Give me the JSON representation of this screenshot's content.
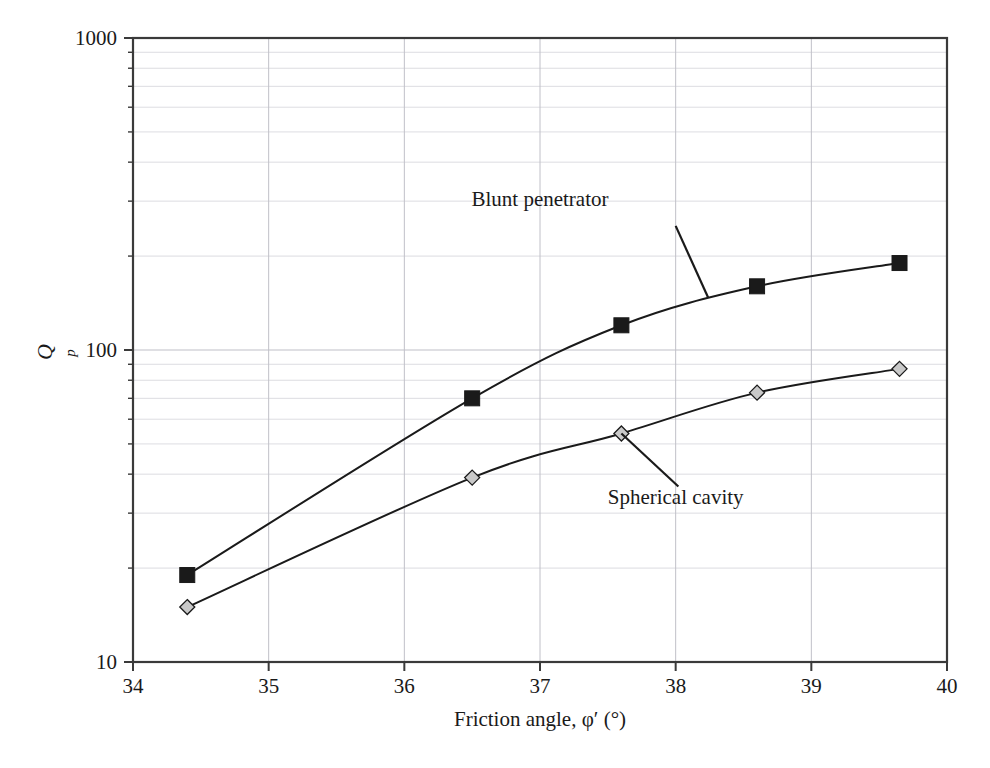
{
  "chart_data": {
    "type": "line",
    "title": "",
    "xlabel": "Friction angle, φ′ (°)",
    "ylabel": "Qp",
    "ylabel_main": "Q",
    "ylabel_sub": "p",
    "xlim": [
      34,
      40
    ],
    "ylim": [
      10,
      1000
    ],
    "yscale": "log",
    "xscale": "linear",
    "grid": true,
    "grid_minor": true,
    "legend": "none",
    "xticks": [
      "34",
      "35",
      "36",
      "37",
      "38",
      "39",
      "40"
    ],
    "xtick_values": [
      34,
      35,
      36,
      37,
      38,
      39,
      40
    ],
    "yticks": [
      "10",
      "100",
      "1000"
    ],
    "ytick_values": [
      10,
      100,
      1000
    ],
    "series": [
      {
        "name": "Blunt penetrator",
        "marker": "filled-square",
        "marker_color": "#1a1a1a",
        "line_color": "#1a1a1a",
        "x": [
          34.4,
          36.5,
          37.6,
          38.6,
          39.65
        ],
        "values": [
          19,
          70,
          120,
          160,
          190
        ]
      },
      {
        "name": "Spherical cavity",
        "marker": "open-diamond",
        "marker_color": "#c9c9c9",
        "line_color": "#1a1a1a",
        "x": [
          34.4,
          36.5,
          37.6,
          38.6,
          39.65
        ],
        "values": [
          15,
          39,
          54,
          73,
          87
        ]
      }
    ],
    "annotations": [
      {
        "text": "Blunt penetrator",
        "label_x": 37.0,
        "label_y": 290,
        "leader_from_x": 38.0,
        "leader_from_y": 250,
        "leader_to_x": 38.24,
        "leader_to_y": 147
      },
      {
        "text": "Spherical cavity",
        "label_x": 38.0,
        "label_y": 32,
        "leader_from_x": 38.02,
        "leader_from_y": 36.5,
        "leader_to_x": 37.6,
        "leader_to_y": 54
      }
    ]
  },
  "axes": {
    "x_title": "Friction angle, φ′ (°)",
    "y_title_main": "Q",
    "y_title_sub": "p",
    "x_tick_labels": [
      "34",
      "35",
      "36",
      "37",
      "38",
      "39",
      "40"
    ],
    "y_tick_labels": [
      "1000",
      "100",
      "10"
    ]
  },
  "annotations": {
    "blunt": "Blunt penetrator",
    "spherical": "Spherical cavity"
  },
  "colors": {
    "frame": "#3a3a3a",
    "grid_major": "#c0c0c8",
    "grid_minor": "#d8d8de",
    "line": "#1a1a1a",
    "marker_fill_square": "#1a1a1a",
    "marker_fill_diamond": "#c9c9c9",
    "background": "#ffffff"
  }
}
